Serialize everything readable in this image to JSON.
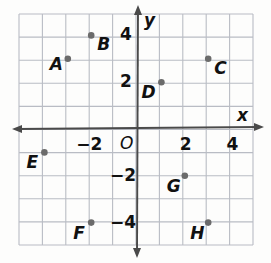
{
  "figure": {
    "kind": "coordinate-plane",
    "title": "",
    "background_color": "#fdfdfc",
    "grid_color": "#b9bcc4",
    "axis_color": "#4a4a4a",
    "point_color": "#6b6b6b",
    "label_color": "#111111"
  },
  "axes": {
    "x_axis_name": "x",
    "y_axis_name": "y",
    "origin_label": "O",
    "x_ticks": [
      {
        "value": -2,
        "label": "−2"
      },
      {
        "value": 2,
        "label": "2"
      },
      {
        "value": 4,
        "label": "4"
      }
    ],
    "y_ticks": [
      {
        "value": 4,
        "label": "4"
      },
      {
        "value": 2,
        "label": "2"
      },
      {
        "value": -2,
        "label": "−2"
      },
      {
        "value": -4,
        "label": "−4"
      }
    ],
    "x_range": [
      -5,
      5
    ],
    "y_range": [
      -5,
      5
    ],
    "grid": true,
    "arrows": [
      "left",
      "right",
      "up",
      "down"
    ]
  },
  "chart_data": {
    "type": "scatter",
    "title": "",
    "xlabel": "x",
    "ylabel": "y",
    "xlim": [
      -5,
      5
    ],
    "ylim": [
      -5,
      5
    ],
    "grid": true,
    "legend": "none",
    "x_tick_labels": [
      "−2",
      "2",
      "4"
    ],
    "y_tick_labels": [
      "4",
      "2",
      "−2",
      "−4"
    ],
    "points": [
      {
        "name": "A",
        "x": -3,
        "y": 3,
        "label_dx": -18,
        "label_dy": 12
      },
      {
        "name": "B",
        "x": -2,
        "y": 4,
        "label_dx": 6,
        "label_dy": 16
      },
      {
        "name": "C",
        "x": 3,
        "y": 3,
        "label_dx": 6,
        "label_dy": 16
      },
      {
        "name": "D",
        "x": 1,
        "y": 2,
        "label_dx": -20,
        "label_dy": 17
      },
      {
        "name": "E",
        "x": -4,
        "y": -1,
        "label_dx": -18,
        "label_dy": 17
      },
      {
        "name": "F",
        "x": -2,
        "y": -4,
        "label_dx": -18,
        "label_dy": 17
      },
      {
        "name": "G",
        "x": 2,
        "y": -2,
        "label_dx": -18,
        "label_dy": 17
      },
      {
        "name": "H",
        "x": 3,
        "y": -4,
        "label_dx": -18,
        "label_dy": 17
      }
    ]
  }
}
